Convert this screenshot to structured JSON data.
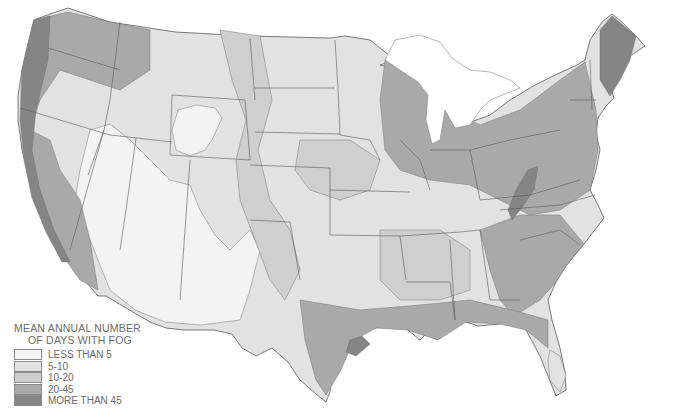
{
  "map": {
    "subject": "United States — mean annual number of days with fog",
    "fill_colors": {
      "lt5": "#f3f3f3",
      "5_10": "#e2e2e2",
      "10_20": "#cfcfcf",
      "20_45": "#a9a9a9",
      "gt45": "#858585",
      "border": "#5a5a5a",
      "water": "#ffffff"
    }
  },
  "legend": {
    "title_line1": "MEAN ANNUAL NUMBER",
    "title_line2": "OF DAYS WITH FOG",
    "items": [
      {
        "label": "LESS THAN 5",
        "color": "#f3f3f3"
      },
      {
        "label": " 5-10",
        "color": "#e2e2e2"
      },
      {
        "label": "10-20",
        "color": "#cfcfcf"
      },
      {
        "label": "20-45",
        "color": "#a9a9a9"
      },
      {
        "label": "MORE THAN 45",
        "color": "#858585"
      }
    ]
  }
}
